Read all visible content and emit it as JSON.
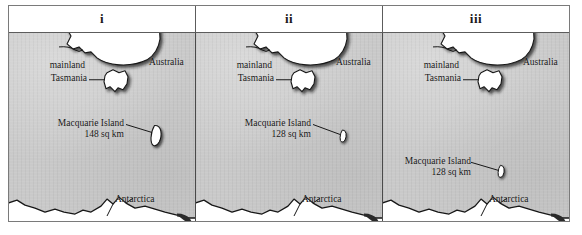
{
  "figure": {
    "panels": [
      {
        "header": "i",
        "labels": {
          "mainland": "mainland",
          "australia": "Australia",
          "tasmania": "Tasmania",
          "macquarie_name": "Macquarie Island",
          "macquarie_area": "148 sq km",
          "antarctica": "Antarctica"
        },
        "island": {
          "size": "large",
          "x_pct": 79,
          "y_pct": 50
        }
      },
      {
        "header": "ii",
        "labels": {
          "mainland": "mainland",
          "australia": "Australia",
          "tasmania": "Tasmania",
          "macquarie_name": "Macquarie Island",
          "macquarie_area": "128 sq km",
          "antarctica": "Antarctica"
        },
        "island": {
          "size": "small",
          "x_pct": 79,
          "y_pct": 50
        }
      },
      {
        "header": "iii",
        "labels": {
          "mainland": "mainland",
          "australia": "Australia",
          "tasmania": "Tasmania",
          "macquarie_name": "Macquarie Island",
          "macquarie_area": "128 sq km",
          "antarctica": "Antarctica"
        },
        "island": {
          "size": "small",
          "x_pct": 63,
          "y_pct": 74
        }
      }
    ],
    "colors": {
      "ocean": "#c9c9c9",
      "land": "#ffffff",
      "outline": "#1a1a1a",
      "frame": "#7a7a7a",
      "text": "#161616"
    }
  }
}
